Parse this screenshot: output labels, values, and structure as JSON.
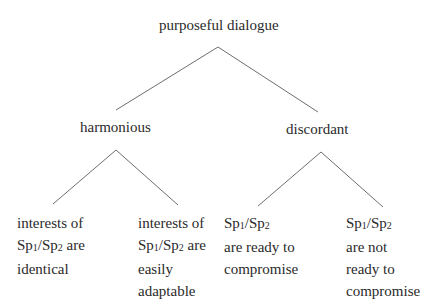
{
  "diagram": {
    "type": "tree",
    "root": {
      "label": "purposeful dialogue",
      "children": [
        {
          "label": "harmonious",
          "children": [
            {
              "lines": [
                "interests of",
                "Sp1/Sp2 are",
                "identical"
              ]
            },
            {
              "lines": [
                "interests of",
                "Sp1/Sp2 are",
                "easily",
                "adaptable"
              ]
            }
          ]
        },
        {
          "label": "discordant",
          "children": [
            {
              "lines": [
                "Sp1/Sp2",
                "are ready to",
                "compromise"
              ]
            },
            {
              "lines": [
                "Sp1/Sp2",
                "are not",
                "ready to",
                "compromise"
              ]
            }
          ]
        }
      ]
    },
    "line_color": "#6e6e6e",
    "text_color": "#2a2a2a"
  }
}
